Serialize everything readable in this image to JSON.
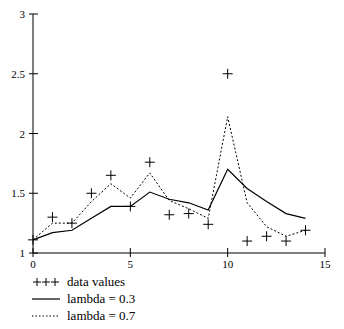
{
  "chart_data": {
    "type": "line",
    "title": "",
    "xlabel": "",
    "ylabel": "",
    "xlim": [
      0,
      15
    ],
    "ylim": [
      1,
      3
    ],
    "x_ticks": [
      0,
      5,
      10,
      15
    ],
    "y_ticks": [
      1,
      1.5,
      2,
      2.5,
      3
    ],
    "x_tick_labels": [
      "0",
      "5",
      "10",
      "15"
    ],
    "y_tick_labels": [
      "1",
      "1.5",
      "2",
      "2.5",
      "3"
    ],
    "grid": false,
    "legend_position": "bottom-left",
    "x": [
      0,
      1,
      2,
      3,
      4,
      5,
      6,
      7,
      8,
      9,
      10,
      11,
      12,
      13,
      14
    ],
    "series": [
      {
        "name": "data values",
        "style": "markers",
        "marker": "+",
        "values": [
          1.11,
          1.3,
          1.25,
          1.5,
          1.65,
          1.39,
          1.76,
          1.32,
          1.33,
          1.24,
          2.5,
          1.1,
          1.14,
          1.1,
          1.19
        ]
      },
      {
        "name": "lambda = 0.3",
        "style": "solid",
        "values": [
          1.11,
          1.17,
          1.19,
          1.29,
          1.39,
          1.39,
          1.51,
          1.45,
          1.42,
          1.36,
          1.7,
          1.54,
          1.43,
          1.33,
          1.29
        ]
      },
      {
        "name": "lambda = 0.7",
        "style": "dotted",
        "values": [
          1.11,
          1.25,
          1.25,
          1.43,
          1.58,
          1.46,
          1.67,
          1.44,
          1.37,
          1.29,
          2.14,
          1.42,
          1.22,
          1.14,
          1.19
        ]
      }
    ]
  },
  "legend": {
    "items": [
      {
        "symbol": "+++",
        "label": "data values"
      },
      {
        "symbol": "solid-line",
        "label": "lambda = 0.3"
      },
      {
        "symbol": "dotted-line",
        "label": "lambda = 0.7"
      }
    ]
  }
}
